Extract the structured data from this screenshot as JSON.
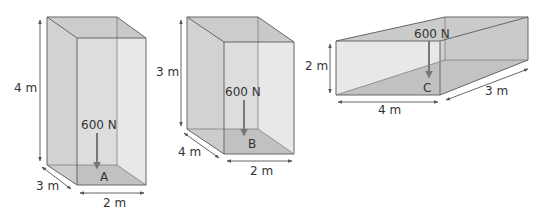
{
  "colors": {
    "face": "#d3d3d3",
    "side": "#c8c8c8",
    "floor": "#a9a9a9",
    "edge": "#666666",
    "arrow": "#777777",
    "dim": "#555555",
    "text": "#333333"
  },
  "boxes": [
    {
      "id": "A",
      "point_label": "A",
      "force_label": "600 N",
      "height_label": "4 m",
      "depth_label": "3 m",
      "width_label": "2 m"
    },
    {
      "id": "B",
      "point_label": "B",
      "force_label": "600 N",
      "height_label": "3 m",
      "depth_label": "4 m",
      "width_label": "2 m"
    },
    {
      "id": "C",
      "point_label": "C",
      "force_label": "600 N",
      "height_label": "2 m",
      "depth_label": "3 m",
      "width_label": "4 m"
    }
  ]
}
